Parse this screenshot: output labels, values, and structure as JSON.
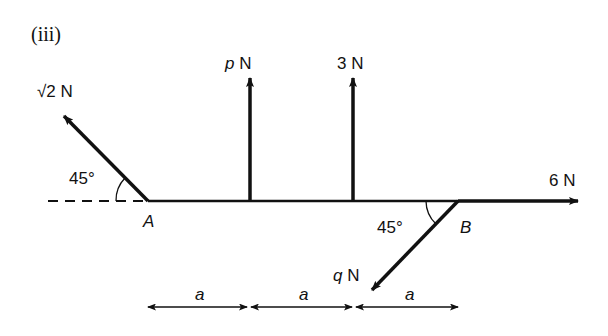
{
  "diagram": {
    "part_label": "(iii)",
    "points": {
      "A": "A",
      "B": "B"
    },
    "forces": [
      {
        "name": "sqrt2",
        "label": "√2 N",
        "direction": "up-left 45° at A"
      },
      {
        "name": "p",
        "label_var": "p",
        "label_unit": " N",
        "direction": "up"
      },
      {
        "name": "3",
        "label": "3 N",
        "direction": "up"
      },
      {
        "name": "6",
        "label": "6 N",
        "direction": "right at B"
      },
      {
        "name": "q",
        "label_var": "q",
        "label_unit": " N",
        "direction": "down-left 45° at B"
      }
    ],
    "angles": {
      "at_A": "45°",
      "at_B": "45°"
    },
    "dimensions": [
      "a",
      "a",
      "a"
    ]
  }
}
